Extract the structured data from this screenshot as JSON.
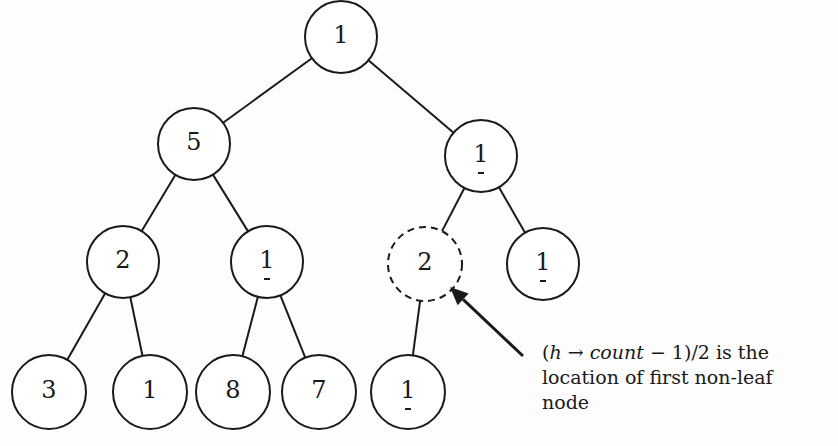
{
  "diagram": {
    "colors": {
      "stroke": "#1a1a1a",
      "background": "#fdfdfd",
      "node_fill": "#ffffff"
    },
    "nodes": [
      {
        "id": "n0",
        "label": "1",
        "cx": 341,
        "cy": 37,
        "r": 36,
        "dashed": false,
        "tick": false
      },
      {
        "id": "n1",
        "label": "5",
        "cx": 194,
        "cy": 144,
        "r": 36,
        "dashed": false,
        "tick": false
      },
      {
        "id": "n2",
        "label": "1",
        "cx": 481,
        "cy": 156,
        "r": 36,
        "dashed": false,
        "tick": true
      },
      {
        "id": "n3",
        "label": "2",
        "cx": 123,
        "cy": 262,
        "r": 36,
        "dashed": false,
        "tick": false
      },
      {
        "id": "n4",
        "label": "1",
        "cx": 267,
        "cy": 262,
        "r": 36,
        "dashed": false,
        "tick": true
      },
      {
        "id": "n5",
        "label": "2",
        "cx": 425,
        "cy": 264,
        "r": 37,
        "dashed": true,
        "tick": false
      },
      {
        "id": "n6",
        "label": "1",
        "cx": 543,
        "cy": 264,
        "r": 36,
        "dashed": false,
        "tick": true
      },
      {
        "id": "n7",
        "label": "3",
        "cx": 49,
        "cy": 392,
        "r": 37,
        "dashed": false,
        "tick": false
      },
      {
        "id": "n8",
        "label": "1",
        "cx": 150,
        "cy": 392,
        "r": 37,
        "dashed": false,
        "tick": false
      },
      {
        "id": "n9",
        "label": "8",
        "cx": 233,
        "cy": 392,
        "r": 37,
        "dashed": false,
        "tick": false
      },
      {
        "id": "n10",
        "label": "7",
        "cx": 319,
        "cy": 392,
        "r": 37,
        "dashed": false,
        "tick": false
      },
      {
        "id": "n11",
        "label": "1",
        "cx": 408,
        "cy": 392,
        "r": 37,
        "dashed": false,
        "tick": true
      }
    ],
    "edges": [
      [
        "n0",
        "n1"
      ],
      [
        "n0",
        "n2"
      ],
      [
        "n1",
        "n3"
      ],
      [
        "n1",
        "n4"
      ],
      [
        "n2",
        "n5"
      ],
      [
        "n2",
        "n6"
      ],
      [
        "n3",
        "n7"
      ],
      [
        "n3",
        "n8"
      ],
      [
        "n4",
        "n9"
      ],
      [
        "n4",
        "n10"
      ],
      [
        "n5",
        "n11"
      ]
    ],
    "highlighted_node": "n5",
    "arrow": {
      "from": [
        523,
        356
      ],
      "to": [
        450,
        287
      ]
    }
  },
  "annotation": {
    "open_paren": "(",
    "var_h": "h",
    "arrow_symbol": " → ",
    "var_count": "count",
    "rest_line1": " − 1)/2 is the",
    "line2": "location of first non-leaf",
    "line3": "node"
  }
}
